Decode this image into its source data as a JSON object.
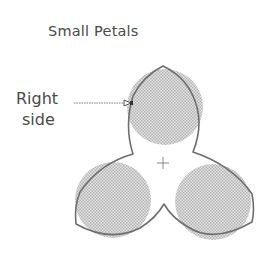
{
  "diagram": {
    "title": "Small Petals",
    "callout": {
      "line1": "Right",
      "line2": "side"
    },
    "center_marker": "+",
    "colors": {
      "outline": "#6e6e6e",
      "hatch_fill": "#c9c9c9",
      "text": "#4a4a4a"
    },
    "petals": [
      {
        "name": "top",
        "circle_center": [
          165,
          107
        ],
        "radius": 38
      },
      {
        "name": "bottom-left",
        "circle_center": [
          113,
          200
        ],
        "radius": 38
      },
      {
        "name": "bottom-right",
        "circle_center": [
          213,
          202
        ],
        "radius": 38
      }
    ]
  }
}
